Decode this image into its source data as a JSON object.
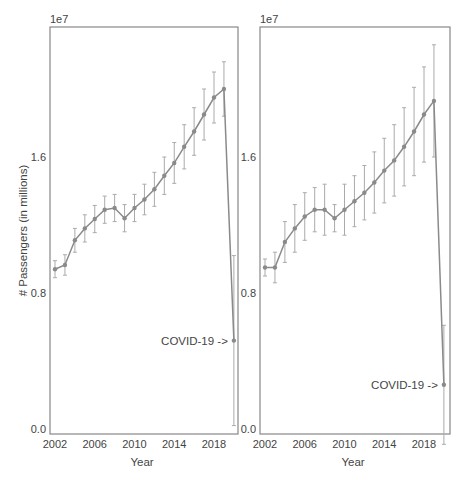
{
  "chart_data": [
    {
      "type": "line",
      "title": "",
      "xlabel": "Year",
      "ylabel": "# Passengers (in millions)",
      "y_offset_label": "1e7",
      "x_ticks": [
        "2002",
        "2006",
        "2010",
        "2014",
        "2018"
      ],
      "y_ticks": [
        "0.0",
        "0.8",
        "1.6"
      ],
      "ylim": [
        0,
        2.4
      ],
      "grid": false,
      "annotation": "COVID-19 ->",
      "x": [
        2002,
        2003,
        2004,
        2005,
        2006,
        2007,
        2008,
        2009,
        2010,
        2011,
        2012,
        2013,
        2014,
        2015,
        2016,
        2017,
        2018,
        2019,
        2020
      ],
      "series": [
        {
          "name": "passengers",
          "values": [
            0.94,
            0.965,
            1.11,
            1.18,
            1.235,
            1.29,
            1.3,
            1.24,
            1.3,
            1.35,
            1.41,
            1.49,
            1.565,
            1.66,
            1.75,
            1.85,
            1.95,
            2.0,
            0.52
          ],
          "error": [
            0.05,
            0.06,
            0.07,
            0.08,
            0.08,
            0.08,
            0.08,
            0.08,
            0.08,
            0.09,
            0.1,
            0.11,
            0.12,
            0.13,
            0.14,
            0.15,
            0.15,
            0.16,
            0.5
          ]
        }
      ]
    },
    {
      "type": "line",
      "title": "",
      "xlabel": "Year",
      "ylabel": "",
      "y_offset_label": "1e7",
      "x_ticks": [
        "2002",
        "2006",
        "2010",
        "2014",
        "2018"
      ],
      "y_ticks": [
        "0.0",
        "0.8",
        "1.6"
      ],
      "ylim": [
        0,
        2.4
      ],
      "grid": false,
      "annotation": "COVID-19 ->",
      "x": [
        2002,
        2003,
        2004,
        2005,
        2006,
        2007,
        2008,
        2009,
        2010,
        2011,
        2012,
        2013,
        2014,
        2015,
        2016,
        2017,
        2018,
        2019,
        2020
      ],
      "series": [
        {
          "name": "passengers",
          "values": [
            0.95,
            0.95,
            1.1,
            1.18,
            1.25,
            1.29,
            1.29,
            1.24,
            1.29,
            1.34,
            1.39,
            1.45,
            1.52,
            1.58,
            1.66,
            1.75,
            1.85,
            1.93,
            0.26
          ],
          "error": [
            0.05,
            0.09,
            0.12,
            0.14,
            0.14,
            0.13,
            0.15,
            0.08,
            0.15,
            0.15,
            0.16,
            0.18,
            0.19,
            0.21,
            0.23,
            0.26,
            0.28,
            0.33,
            0.35
          ]
        }
      ]
    }
  ]
}
